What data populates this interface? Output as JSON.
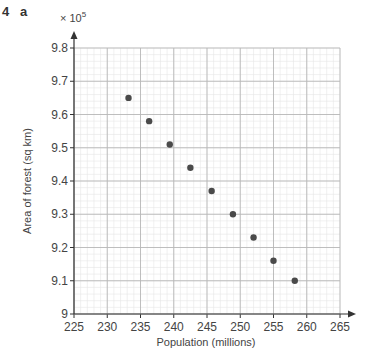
{
  "header": {
    "question_number": "4",
    "part": "a"
  },
  "chart_data": {
    "type": "scatter",
    "title": "",
    "xlabel": "Population (millions)",
    "ylabel": "Area of forest (sq km)",
    "y_multiplier": "× 10^5",
    "xlim": [
      225,
      265
    ],
    "ylim": [
      9.0,
      9.8
    ],
    "x_ticks": [
      225,
      230,
      235,
      240,
      245,
      250,
      255,
      260,
      265
    ],
    "y_ticks": [
      9,
      9.1,
      9.2,
      9.3,
      9.4,
      9.5,
      9.6,
      9.7,
      9.8
    ],
    "x_tick_labels": [
      "225",
      "230",
      "235",
      "240",
      "245",
      "250",
      "255",
      "260",
      "265"
    ],
    "y_tick_labels": [
      "9",
      "9.1",
      "9.2",
      "9.3",
      "9.4",
      "9.5",
      "9.6",
      "9.7",
      "9.8"
    ],
    "grid": true,
    "legend": null,
    "points": [
      {
        "x": 233.2,
        "y": 9.65
      },
      {
        "x": 236.3,
        "y": 9.58
      },
      {
        "x": 239.4,
        "y": 9.51
      },
      {
        "x": 242.5,
        "y": 9.44
      },
      {
        "x": 245.7,
        "y": 9.37
      },
      {
        "x": 248.9,
        "y": 9.3
      },
      {
        "x": 252.0,
        "y": 9.23
      },
      {
        "x": 255.0,
        "y": 9.16
      },
      {
        "x": 258.2,
        "y": 9.1
      }
    ],
    "colors": {
      "points": "#4a4a4a",
      "minor_grid": "#e6e6e6",
      "major_grid": "#b8b8b8",
      "axis": "#333333"
    }
  },
  "axis_labels": {
    "x": "Population (millions)",
    "y": "Area of forest (sq km)",
    "multiplier_base": "× 10",
    "multiplier_exp": "5"
  }
}
